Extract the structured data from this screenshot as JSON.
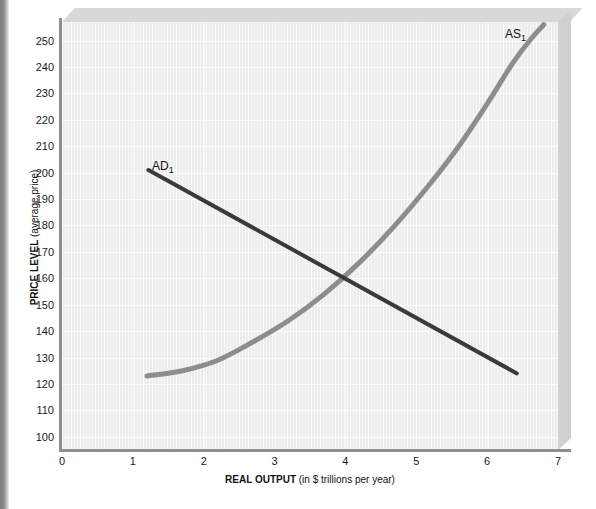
{
  "figure": {
    "background_color": "#ffffff",
    "plot_background_color": "#ededed",
    "edge_strip_color": "#8d8d8d"
  },
  "chart_data": {
    "type": "line",
    "title": "",
    "xlabel_bold": "REAL OUTPUT",
    "xlabel_rest": " (in $ trillions per year)",
    "ylabel_bold": "PRICE LEVEL",
    "ylabel_rest": " (average price)",
    "xlim": [
      0,
      7
    ],
    "ylim": [
      95,
      257
    ],
    "xticks": [
      0,
      1,
      2,
      3,
      4,
      5,
      6,
      7
    ],
    "yticks": [
      100,
      110,
      120,
      130,
      140,
      150,
      160,
      170,
      180,
      190,
      200,
      210,
      220,
      230,
      240,
      250
    ],
    "grid": true,
    "legend_position": "inline-labels",
    "equilibrium": {
      "output": 4.0,
      "price_level": 160
    },
    "series": [
      {
        "name": "AD1",
        "label": "AD",
        "label_subscript": "1",
        "color": "#3a3a3a",
        "line_width": 4,
        "kind": "aggregate-demand",
        "points": [
          {
            "x": 1.22,
            "y": 201
          },
          {
            "x": 6.42,
            "y": 124
          }
        ]
      },
      {
        "name": "AS1",
        "label": "AS",
        "label_subscript": "1",
        "color": "#8d8d8d",
        "line_width": 5,
        "kind": "aggregate-supply",
        "points": [
          {
            "x": 1.2,
            "y": 123
          },
          {
            "x": 1.7,
            "y": 125
          },
          {
            "x": 2.2,
            "y": 129
          },
          {
            "x": 2.7,
            "y": 136
          },
          {
            "x": 3.2,
            "y": 144
          },
          {
            "x": 3.7,
            "y": 154
          },
          {
            "x": 4.2,
            "y": 166
          },
          {
            "x": 4.7,
            "y": 180
          },
          {
            "x": 5.2,
            "y": 196
          },
          {
            "x": 5.6,
            "y": 210
          },
          {
            "x": 6.0,
            "y": 226
          },
          {
            "x": 6.35,
            "y": 241
          },
          {
            "x": 6.6,
            "y": 250
          },
          {
            "x": 6.8,
            "y": 256
          }
        ]
      }
    ]
  }
}
